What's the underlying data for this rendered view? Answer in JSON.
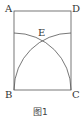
{
  "figure": {
    "caption": "图1",
    "points": {
      "A": {
        "label": "A"
      },
      "B": {
        "label": "B"
      },
      "C": {
        "label": "C"
      },
      "D": {
        "label": "D"
      },
      "E": {
        "label": "E"
      }
    },
    "shapes": [
      {
        "type": "rectangle",
        "vertices": [
          "A",
          "B",
          "C",
          "D"
        ]
      },
      {
        "type": "arc",
        "center": "B",
        "from": "C",
        "to": "side AB",
        "radius": "BC"
      },
      {
        "type": "arc",
        "center": "C",
        "from": "B",
        "to": "side DC",
        "radius": "BC"
      }
    ],
    "intersection": "E",
    "stroke_color": "#555555"
  }
}
